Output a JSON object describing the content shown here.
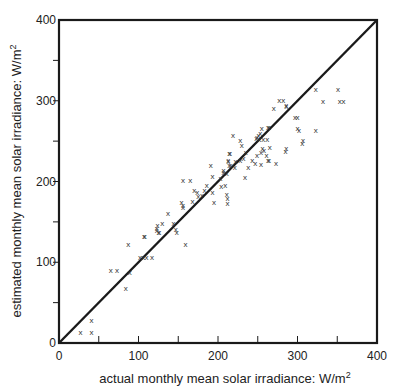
{
  "chart_data": {
    "type": "scatter",
    "title": "",
    "xlabel": "actual monthly mean solar irradiance: W/m²",
    "ylabel": "estimated monthly mean solar irradiance: W/m²",
    "xlim": [
      0,
      400
    ],
    "ylim": [
      0,
      400
    ],
    "grid": false,
    "legend": null,
    "x_ticks": [
      0,
      100,
      200,
      300,
      400
    ],
    "y_ticks": [
      0,
      100,
      200,
      300,
      400
    ],
    "x_minor_ticks": [
      50,
      100,
      150,
      200,
      250,
      300,
      350
    ],
    "y_minor_ticks": [
      50,
      100,
      150,
      200,
      250,
      300,
      350
    ],
    "marker": "x",
    "reference_line": {
      "label": "y = x",
      "from": [
        0,
        0
      ],
      "to": [
        400,
        400
      ]
    },
    "series": [
      {
        "name": "monthly means",
        "points": [
          [
            27,
            14
          ],
          [
            41,
            14
          ],
          [
            41,
            29
          ],
          [
            84,
            68
          ],
          [
            89,
            88
          ],
          [
            65,
            90
          ],
          [
            73,
            90
          ],
          [
            102,
            106
          ],
          [
            106,
            106
          ],
          [
            110,
            106
          ],
          [
            117,
            106
          ],
          [
            87,
            123
          ],
          [
            107,
            133
          ],
          [
            108,
            133
          ],
          [
            123,
            142
          ],
          [
            125,
            138
          ],
          [
            124,
            146
          ],
          [
            130,
            149
          ],
          [
            123,
            140
          ],
          [
            126,
            137
          ],
          [
            137,
            161
          ],
          [
            144,
            149
          ],
          [
            147,
            141
          ],
          [
            148,
            138
          ],
          [
            154,
            175
          ],
          [
            156,
            168
          ],
          [
            159,
            123
          ],
          [
            168,
            176
          ],
          [
            156,
            202
          ],
          [
            165,
            202
          ],
          [
            170,
            189
          ],
          [
            174,
            187
          ],
          [
            175,
            182
          ],
          [
            156,
            171
          ],
          [
            186,
            196
          ],
          [
            183,
            190
          ],
          [
            180,
            183
          ],
          [
            193,
            207
          ],
          [
            193,
            187
          ],
          [
            195,
            175
          ],
          [
            191,
            220
          ],
          [
            203,
            204
          ],
          [
            204,
            194
          ],
          [
            207,
            214
          ],
          [
            211,
            210
          ],
          [
            209,
            196
          ],
          [
            213,
            227
          ],
          [
            215,
            235
          ],
          [
            214,
            220
          ],
          [
            211,
            185
          ],
          [
            212,
            179
          ],
          [
            212,
            173
          ],
          [
            219,
            258
          ],
          [
            228,
            251
          ],
          [
            230,
            245
          ],
          [
            214,
            235
          ],
          [
            213,
            225
          ],
          [
            216,
            220
          ],
          [
            222,
            225
          ],
          [
            221,
            218
          ],
          [
            228,
            227
          ],
          [
            232,
            229
          ],
          [
            235,
            237
          ],
          [
            238,
            218
          ],
          [
            243,
            227
          ],
          [
            247,
            223
          ],
          [
            249,
            255
          ],
          [
            253,
            260
          ],
          [
            257,
            253
          ],
          [
            262,
            253
          ],
          [
            264,
            268
          ],
          [
            254,
            237
          ],
          [
            258,
            239
          ],
          [
            261,
            233
          ],
          [
            249,
            233
          ],
          [
            264,
            227
          ],
          [
            234,
            206
          ],
          [
            207,
            212
          ],
          [
            270,
            291
          ],
          [
            277,
            301
          ],
          [
            282,
            301
          ],
          [
            286,
            295
          ],
          [
            263,
            267
          ],
          [
            255,
            266
          ],
          [
            251,
            258
          ],
          [
            248,
            254
          ],
          [
            252,
            253
          ],
          [
            265,
            243
          ],
          [
            256,
            241
          ],
          [
            286,
            241
          ],
          [
            297,
            280
          ],
          [
            300,
            266
          ],
          [
            323,
            315
          ],
          [
            332,
            300
          ],
          [
            351,
            314
          ],
          [
            353,
            300
          ],
          [
            358,
            300
          ],
          [
            286,
            293
          ],
          [
            300,
            280
          ],
          [
            302,
            264
          ],
          [
            323,
            264
          ],
          [
            307,
            251
          ],
          [
            306,
            248
          ],
          [
            285,
            238
          ],
          [
            273,
            223
          ],
          [
            254,
            222
          ],
          [
            263,
            227
          ]
        ]
      }
    ]
  },
  "axes": {
    "x_title": "actual monthly mean solar irradiance: W/m",
    "x_title_sup": "2",
    "y_title": "estimated monthly mean solar irradiance: W/m",
    "y_title_sup": "2",
    "x_tick_labels": [
      "0",
      "100",
      "200",
      "300",
      "400"
    ],
    "y_tick_labels": [
      "0",
      "100",
      "200",
      "300",
      "400"
    ]
  },
  "colors": {
    "ink": "#1a1a1a",
    "background": "#ffffff"
  }
}
